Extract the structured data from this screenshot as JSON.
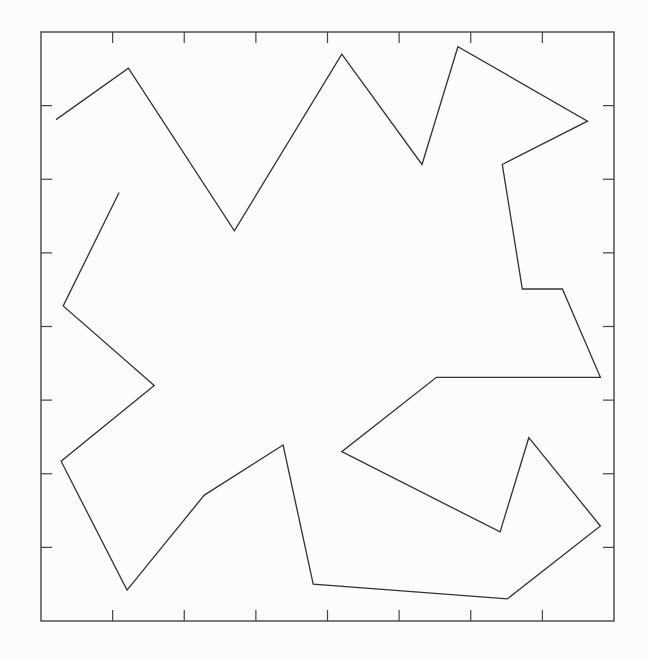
{
  "chart_data": {
    "type": "line",
    "title": "",
    "xlabel": "",
    "ylabel": "",
    "xlim": [
      0,
      8
    ],
    "ylim": [
      0,
      8
    ],
    "grid": false,
    "legend": null,
    "x_ticks": [
      1,
      2,
      3,
      4,
      5,
      6,
      7
    ],
    "y_ticks": [
      1,
      2,
      3,
      4,
      5,
      6,
      7
    ],
    "tick_labels_shown": false,
    "line_color": "#333333",
    "frame_color": "#444444",
    "series": [
      {
        "name": "polyline",
        "points": [
          [
            0.21,
            6.81
          ],
          [
            1.22,
            7.51
          ],
          [
            2.7,
            5.3
          ],
          [
            4.2,
            7.7
          ],
          [
            5.32,
            6.2
          ],
          [
            5.82,
            7.8
          ],
          [
            7.63,
            6.79
          ],
          [
            6.44,
            6.2
          ],
          [
            6.72,
            4.51
          ],
          [
            7.28,
            4.51
          ],
          [
            7.81,
            3.31
          ],
          [
            5.52,
            3.31
          ],
          [
            4.2,
            2.3
          ],
          [
            6.41,
            1.21
          ],
          [
            6.81,
            2.49
          ],
          [
            7.81,
            1.29
          ],
          [
            6.51,
            0.3
          ],
          [
            3.8,
            0.5
          ],
          [
            3.38,
            2.39
          ],
          [
            2.28,
            1.71
          ],
          [
            1.2,
            0.42
          ],
          [
            0.28,
            2.17
          ],
          [
            1.58,
            3.2
          ],
          [
            0.31,
            4.28
          ],
          [
            1.09,
            5.82
          ]
        ]
      }
    ]
  },
  "layout": {
    "plot_left_px": 41,
    "plot_top_px": 32,
    "plot_right_px": 614,
    "plot_bottom_px": 621
  }
}
